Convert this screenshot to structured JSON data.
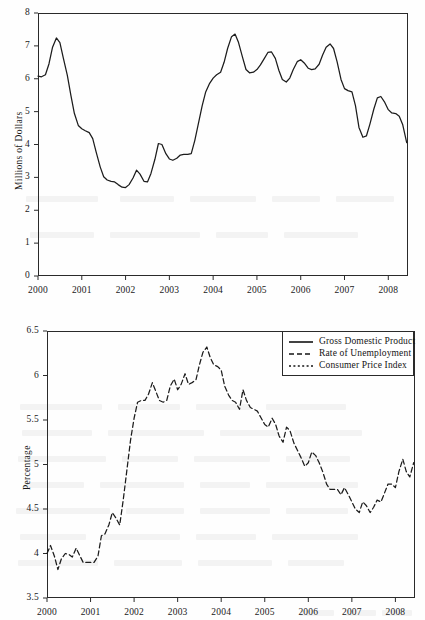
{
  "figure": {
    "background_color": "#fefefe",
    "ink_color": "#2a2a2a",
    "panel_count": 2
  },
  "chart_data": [
    {
      "id": "top-panel",
      "type": "line",
      "title": "",
      "subtitle": "",
      "xlabel": "",
      "ylabel": "Millions of Dollars",
      "xlim": [
        2000.0,
        2008.45
      ],
      "ylim": [
        0,
        8
      ],
      "grid": false,
      "legend_position": "none",
      "xticks": [
        "2000",
        "2001",
        "2002",
        "2003",
        "2004",
        "2005",
        "2006",
        "2007",
        "2008"
      ],
      "xtick_values": [
        2000,
        2001,
        2002,
        2003,
        2004,
        2005,
        2006,
        2007,
        2008
      ],
      "yticks": [
        "0",
        "1",
        "2",
        "3",
        "4",
        "5",
        "6",
        "7",
        "8"
      ],
      "ytick_values": [
        0,
        1,
        2,
        3,
        4,
        5,
        6,
        7,
        8
      ],
      "series": [
        {
          "name": "Gross Domestic Product",
          "style": "solid",
          "color": "#1c1c1c",
          "x": [
            2000.0,
            2000.08,
            2000.17,
            2000.25,
            2000.33,
            2000.42,
            2000.5,
            2000.58,
            2000.67,
            2000.75,
            2000.83,
            2000.92,
            2001.0,
            2001.08,
            2001.17,
            2001.25,
            2001.33,
            2001.42,
            2001.5,
            2001.58,
            2001.67,
            2001.75,
            2001.83,
            2001.92,
            2002.0,
            2002.08,
            2002.17,
            2002.25,
            2002.33,
            2002.42,
            2002.5,
            2002.58,
            2002.67,
            2002.75,
            2002.83,
            2002.92,
            2003.0,
            2003.08,
            2003.17,
            2003.25,
            2003.33,
            2003.42,
            2003.5,
            2003.58,
            2003.67,
            2003.75,
            2003.83,
            2003.92,
            2004.0,
            2004.08,
            2004.17,
            2004.25,
            2004.33,
            2004.42,
            2004.5,
            2004.58,
            2004.67,
            2004.75,
            2004.83,
            2004.92,
            2005.0,
            2005.08,
            2005.17,
            2005.25,
            2005.33,
            2005.42,
            2005.5,
            2005.58,
            2005.67,
            2005.75,
            2005.83,
            2005.92,
            2006.0,
            2006.08,
            2006.17,
            2006.25,
            2006.33,
            2006.42,
            2006.5,
            2006.58,
            2006.67,
            2006.75,
            2006.83,
            2006.92,
            2007.0,
            2007.08,
            2007.17,
            2007.25,
            2007.33,
            2007.42,
            2007.5,
            2007.58,
            2007.67,
            2007.75,
            2007.83,
            2007.92,
            2008.0,
            2008.08,
            2008.17,
            2008.25,
            2008.33,
            2008.42
          ],
          "values": [
            6.08,
            6.06,
            6.12,
            6.45,
            6.95,
            7.24,
            7.1,
            6.62,
            6.1,
            5.5,
            4.95,
            4.58,
            4.48,
            4.42,
            4.36,
            4.18,
            3.76,
            3.32,
            3.02,
            2.92,
            2.88,
            2.86,
            2.78,
            2.7,
            2.69,
            2.78,
            2.98,
            3.22,
            3.1,
            2.88,
            2.86,
            3.12,
            3.55,
            4.03,
            4.0,
            3.72,
            3.56,
            3.52,
            3.58,
            3.68,
            3.7,
            3.7,
            3.72,
            4.12,
            4.68,
            5.18,
            5.6,
            5.86,
            6.02,
            6.12,
            6.2,
            6.5,
            6.92,
            7.28,
            7.36,
            7.1,
            6.66,
            6.28,
            6.18,
            6.2,
            6.28,
            6.42,
            6.62,
            6.8,
            6.82,
            6.62,
            6.26,
            5.98,
            5.9,
            6.02,
            6.28,
            6.52,
            6.58,
            6.48,
            6.32,
            6.28,
            6.3,
            6.44,
            6.72,
            6.96,
            7.06,
            6.92,
            6.52,
            5.98,
            5.7,
            5.64,
            5.6,
            5.18,
            4.52,
            4.22,
            4.26,
            4.62,
            5.08,
            5.42,
            5.46,
            5.28,
            5.06,
            4.96,
            4.94,
            4.86,
            4.6,
            4.06
          ]
        }
      ]
    },
    {
      "id": "bottom-panel",
      "type": "line",
      "title": "",
      "subtitle": "",
      "xlabel": "",
      "ylabel": "Percentage",
      "xlim": [
        2000.0,
        2008.45
      ],
      "ylim": [
        3.5,
        6.5
      ],
      "grid": false,
      "legend_position": "top-right",
      "xticks": [
        "2000",
        "2001",
        "2002",
        "2003",
        "2004",
        "2005",
        "2006",
        "2007",
        "2008"
      ],
      "xtick_values": [
        2000,
        2001,
        2002,
        2003,
        2004,
        2005,
        2006,
        2007,
        2008
      ],
      "yticks": [
        "3.5",
        "4",
        "4.5",
        "5",
        "5.5",
        "6",
        "6.5"
      ],
      "ytick_values": [
        3.5,
        4,
        4.5,
        5,
        5.5,
        6,
        6.5
      ],
      "legend": [
        {
          "label": "Gross Domestic Product",
          "style": "solid"
        },
        {
          "label": "Rate of Unemployment",
          "style": "dashed"
        },
        {
          "label": "Consumer Price Index",
          "style": "dotted"
        }
      ],
      "series": [
        {
          "name": "Rate of Unemployment",
          "style": "dashed",
          "color": "#1c1c1c",
          "x": [
            2000.0,
            2000.08,
            2000.17,
            2000.25,
            2000.33,
            2000.42,
            2000.5,
            2000.58,
            2000.67,
            2000.75,
            2000.83,
            2000.92,
            2001.0,
            2001.08,
            2001.17,
            2001.25,
            2001.33,
            2001.42,
            2001.5,
            2001.58,
            2001.67,
            2001.75,
            2001.83,
            2001.92,
            2002.0,
            2002.08,
            2002.17,
            2002.25,
            2002.33,
            2002.42,
            2002.5,
            2002.58,
            2002.67,
            2002.75,
            2002.83,
            2002.92,
            2003.0,
            2003.08,
            2003.17,
            2003.25,
            2003.33,
            2003.42,
            2003.5,
            2003.58,
            2003.67,
            2003.75,
            2003.83,
            2003.92,
            2004.0,
            2004.08,
            2004.17,
            2004.25,
            2004.33,
            2004.42,
            2004.5,
            2004.58,
            2004.67,
            2004.75,
            2004.83,
            2004.92,
            2005.0,
            2005.08,
            2005.17,
            2005.25,
            2005.33,
            2005.42,
            2005.5,
            2005.58,
            2005.67,
            2005.75,
            2005.83,
            2005.92,
            2006.0,
            2006.08,
            2006.17,
            2006.25,
            2006.33,
            2006.42,
            2006.5,
            2006.58,
            2006.67,
            2006.75,
            2006.83,
            2006.92,
            2007.0,
            2007.08,
            2007.17,
            2007.25,
            2007.33,
            2007.42,
            2007.5,
            2007.58,
            2007.67,
            2007.75,
            2007.83,
            2007.92,
            2008.0,
            2008.08,
            2008.17,
            2008.25,
            2008.33,
            2008.42
          ],
          "values": [
            4.0,
            4.09,
            3.97,
            3.82,
            3.94,
            4.0,
            3.99,
            3.96,
            4.06,
            3.98,
            3.9,
            3.9,
            3.9,
            3.9,
            3.97,
            4.2,
            4.22,
            4.32,
            4.46,
            4.4,
            4.32,
            4.6,
            4.92,
            5.28,
            5.52,
            5.7,
            5.72,
            5.72,
            5.79,
            5.92,
            5.82,
            5.72,
            5.7,
            5.72,
            5.88,
            5.96,
            5.84,
            5.9,
            6.02,
            5.9,
            5.92,
            5.95,
            6.12,
            6.26,
            6.32,
            6.2,
            6.12,
            6.1,
            6.06,
            5.88,
            5.78,
            5.72,
            5.7,
            5.62,
            5.84,
            5.72,
            5.64,
            5.62,
            5.6,
            5.52,
            5.45,
            5.42,
            5.52,
            5.45,
            5.32,
            5.25,
            5.42,
            5.38,
            5.24,
            5.16,
            5.08,
            4.98,
            5.02,
            5.14,
            5.1,
            5.02,
            4.92,
            4.78,
            4.72,
            4.72,
            4.72,
            4.66,
            4.74,
            4.66,
            4.58,
            4.5,
            4.46,
            4.58,
            4.54,
            4.46,
            4.52,
            4.6,
            4.58,
            4.68,
            4.78,
            4.78,
            4.74,
            4.92,
            5.06,
            4.92,
            4.86,
            5.02
          ]
        }
      ]
    }
  ],
  "ghost_marks": [
    {
      "x": 26,
      "y": 196,
      "w": 72
    },
    {
      "x": 120,
      "y": 196,
      "w": 54
    },
    {
      "x": 190,
      "y": 196,
      "w": 66
    },
    {
      "x": 272,
      "y": 196,
      "w": 48
    },
    {
      "x": 336,
      "y": 196,
      "w": 58
    },
    {
      "x": 30,
      "y": 232,
      "w": 64
    },
    {
      "x": 110,
      "y": 232,
      "w": 90
    },
    {
      "x": 216,
      "y": 232,
      "w": 52
    },
    {
      "x": 284,
      "y": 232,
      "w": 74
    },
    {
      "x": 20,
      "y": 404,
      "w": 82
    },
    {
      "x": 118,
      "y": 404,
      "w": 62
    },
    {
      "x": 196,
      "y": 404,
      "w": 54
    },
    {
      "x": 266,
      "y": 404,
      "w": 80
    },
    {
      "x": 22,
      "y": 430,
      "w": 70
    },
    {
      "x": 108,
      "y": 430,
      "w": 96
    },
    {
      "x": 220,
      "y": 430,
      "w": 58
    },
    {
      "x": 294,
      "y": 430,
      "w": 68
    },
    {
      "x": 18,
      "y": 456,
      "w": 88
    },
    {
      "x": 122,
      "y": 456,
      "w": 56
    },
    {
      "x": 194,
      "y": 456,
      "w": 76
    },
    {
      "x": 286,
      "y": 456,
      "w": 64
    },
    {
      "x": 24,
      "y": 482,
      "w": 60
    },
    {
      "x": 100,
      "y": 482,
      "w": 84
    },
    {
      "x": 200,
      "y": 482,
      "w": 50
    },
    {
      "x": 266,
      "y": 482,
      "w": 92
    },
    {
      "x": 16,
      "y": 508,
      "w": 94
    },
    {
      "x": 126,
      "y": 508,
      "w": 58
    },
    {
      "x": 200,
      "y": 508,
      "w": 70
    },
    {
      "x": 286,
      "y": 508,
      "w": 62
    },
    {
      "x": 20,
      "y": 534,
      "w": 66
    },
    {
      "x": 102,
      "y": 534,
      "w": 78
    },
    {
      "x": 196,
      "y": 534,
      "w": 60
    },
    {
      "x": 272,
      "y": 534,
      "w": 86
    },
    {
      "x": 18,
      "y": 560,
      "w": 80
    },
    {
      "x": 114,
      "y": 560,
      "w": 68
    },
    {
      "x": 198,
      "y": 560,
      "w": 74
    },
    {
      "x": 288,
      "y": 560,
      "w": 56
    },
    {
      "x": 300,
      "y": 610,
      "w": 34
    },
    {
      "x": 346,
      "y": 610,
      "w": 30
    },
    {
      "x": 382,
      "y": 610,
      "w": 30
    }
  ]
}
